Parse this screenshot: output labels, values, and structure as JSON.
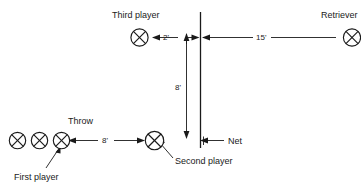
{
  "diagram": {
    "background_color": "#ffffff",
    "ink_color": "#1a1a1a",
    "labels": {
      "third_player": "Third player",
      "retriever": "Retriever",
      "throw": "Throw",
      "first_player": "First player",
      "second_player": "Second player",
      "net": "Net"
    },
    "dimensions": {
      "two_feet": "2'",
      "fifteen_feet": "15'",
      "eight_feet_vertical": "8'",
      "eight_feet_horizontal": "8'"
    },
    "markers": {
      "player_symbol": "circle-x-player-marker",
      "queue_count": 3
    }
  }
}
